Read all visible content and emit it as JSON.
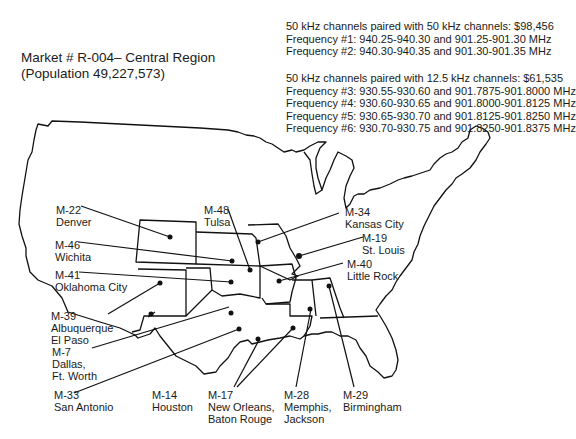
{
  "title": {
    "market": "Market # R-004– Central Region",
    "population": "(Population 49,227,573)"
  },
  "pricing": {
    "group1": {
      "heading": "50 kHz channels paired with 50 kHz channels: $98,456",
      "lines": [
        "Frequency #1: 940.25-940.30 and 901.25-901.30 MHz",
        "Frequency #2: 940.30-940.35 and 901.30-901.35 MHz"
      ]
    },
    "group2": {
      "heading": "50 kHz channels paired with 12.5 kHz channels: $61,535",
      "lines": [
        "Frequency #3: 930.55-930.60 and 901.7875-901.8000 MHz",
        "Frequency #4: 930.60-930.65 and 901.8000-901.8125 MHz",
        "Frequency #5: 930.65-930.70 and 901.8125-901.8250 MHz",
        "Frequency #6: 930.70-930.75 and 901.8250-901.8375 MHz"
      ]
    }
  },
  "markets": [
    {
      "code": "M-22",
      "name": "Denver"
    },
    {
      "code": "M-46",
      "name": "Wichita"
    },
    {
      "code": "M-41",
      "name": "Oklahoma City"
    },
    {
      "code": "M-39",
      "name": "Albuquerque"
    },
    {
      "code": "M-39b",
      "name": "El Paso"
    },
    {
      "code": "M-7",
      "name": "Dallas,",
      "name2": "Ft. Worth"
    },
    {
      "code": "M-33",
      "name": "San Antonio"
    },
    {
      "code": "M-14",
      "name": "Houston"
    },
    {
      "code": "M-17",
      "name": "New Orleans,",
      "name2": "Baton Rouge"
    },
    {
      "code": "M-28",
      "name": "Memphis,",
      "name2": "Jackson"
    },
    {
      "code": "M-29",
      "name": "Birmingham"
    },
    {
      "code": "M-48",
      "name": "Tulsa"
    },
    {
      "code": "M-34",
      "name": "Kansas City"
    },
    {
      "code": "M-19",
      "name": "St. Louis"
    },
    {
      "code": "M-40",
      "name": "Little Rock"
    }
  ],
  "labels": {
    "m22": {
      "code": "M-22",
      "name": "Denver"
    },
    "m46": {
      "code": "M-46",
      "name": "Wichita"
    },
    "m41": {
      "code": "M-41",
      "name": "Oklahoma City"
    },
    "m39": {
      "code": "M-39",
      "name": "Albuquerque",
      "name2": "El Paso"
    },
    "m7": {
      "code": "M-7",
      "name": "Dallas,",
      "name2": "Ft. Worth"
    },
    "m33": {
      "code": "M-33",
      "name": "San Antonio"
    },
    "m14": {
      "code": "M-14",
      "name": "Houston"
    },
    "m17": {
      "code": "M-17",
      "name": "New Orleans,",
      "name2": "Baton Rouge"
    },
    "m28": {
      "code": "M-28",
      "name": "Memphis,",
      "name2": "Jackson"
    },
    "m29": {
      "code": "M-29",
      "name": "Birmingham"
    },
    "m48": {
      "code": "M-48",
      "name": "Tulsa"
    },
    "m34": {
      "code": "M-34",
      "name": "Kansas City"
    },
    "m19": {
      "code": "M-19",
      "name": "St. Louis"
    },
    "m40": {
      "code": "M-40",
      "name": "Little Rock"
    }
  }
}
